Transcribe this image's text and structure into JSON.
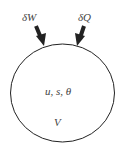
{
  "diagram": {
    "type": "thermodynamic-system",
    "labels": {
      "work": "δW",
      "heat": "δQ",
      "state_vars": "u, s, θ",
      "volume": "V"
    },
    "colors": {
      "stroke": "#222222",
      "text": "#444444",
      "background": "#ffffff"
    }
  }
}
